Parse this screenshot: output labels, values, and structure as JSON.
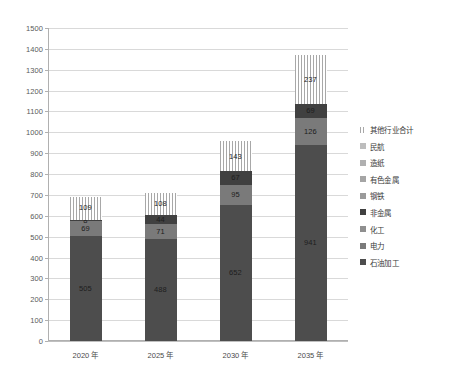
{
  "chart_data": {
    "type": "bar",
    "stacked": true,
    "title": "",
    "xlabel": "",
    "ylabel": "",
    "categories": [
      "2020 年",
      "2025 年",
      "2030 年",
      "2035 年"
    ],
    "ylim": [
      0,
      1500
    ],
    "ytick_step": 100,
    "ytick_labels": [
      "0",
      "100",
      "200",
      "300",
      "400",
      "500",
      "600",
      "700",
      "800",
      "900",
      "1000",
      "1100",
      "1200",
      "1300",
      "1400",
      "1500"
    ],
    "grid": true,
    "legend_position": "right",
    "series": [
      {
        "name": "石油加工",
        "color": "#4d4d4d",
        "pattern": "solid",
        "values": [
          505,
          488,
          652,
          941
        ],
        "labels": [
          "505",
          "488",
          "652",
          "941"
        ]
      },
      {
        "name": "电力",
        "color": "#7a7a7a",
        "pattern": "solid",
        "values": [
          69,
          71,
          95,
          126
        ],
        "labels": [
          "69",
          "71",
          "95",
          "126"
        ]
      },
      {
        "name": "化工",
        "color": "#8f8f8f",
        "pattern": "solid",
        "values": [
          0,
          0,
          0,
          0
        ],
        "labels": [
          "",
          "",
          "",
          ""
        ]
      },
      {
        "name": "非金属",
        "color": "#404040",
        "pattern": "solid",
        "values": [
          8,
          44,
          67,
          69
        ],
        "labels": [
          "8",
          "44",
          "67",
          "69"
        ]
      },
      {
        "name": "钢铁",
        "color": "#9a9a9a",
        "pattern": "solid",
        "values": [
          0,
          0,
          0,
          0
        ],
        "labels": [
          "",
          "",
          "",
          ""
        ]
      },
      {
        "name": "有色金属",
        "color": "#a5a5a5",
        "pattern": "solid",
        "values": [
          0,
          0,
          0,
          0
        ],
        "labels": [
          "",
          "",
          "",
          ""
        ]
      },
      {
        "name": "造纸",
        "color": "#b0b0b0",
        "pattern": "solid",
        "values": [
          0,
          0,
          0,
          0
        ],
        "labels": [
          "",
          "",
          "",
          ""
        ]
      },
      {
        "name": "民航",
        "color": "#bdbdbd",
        "pattern": "solid",
        "values": [
          0,
          0,
          0,
          0
        ],
        "labels": [
          "",
          "",
          "",
          ""
        ]
      },
      {
        "name": "其他行业合计",
        "color": "#ffffff",
        "pattern": "striped",
        "values": [
          109,
          108,
          143,
          237
        ],
        "labels": [
          "109",
          "108",
          "143",
          "237"
        ]
      }
    ],
    "legend_order": [
      "其他行业合计",
      "民航",
      "造纸",
      "有色金属",
      "钢铁",
      "非金属",
      "化工",
      "电力",
      "石油加工"
    ],
    "totals": [
      691,
      711,
      957,
      1373
    ]
  },
  "legend": {
    "items": [
      {
        "label": "其他行业合计",
        "color": "#ffffff",
        "pattern": "striped"
      },
      {
        "label": "民航",
        "color": "#bdbdbd",
        "pattern": "solid"
      },
      {
        "label": "造纸",
        "color": "#b0b0b0",
        "pattern": "solid"
      },
      {
        "label": "有色金属",
        "color": "#a5a5a5",
        "pattern": "solid"
      },
      {
        "label": "钢铁",
        "color": "#9a9a9a",
        "pattern": "solid"
      },
      {
        "label": "非金属",
        "color": "#404040",
        "pattern": "solid"
      },
      {
        "label": "化工",
        "color": "#8f8f8f",
        "pattern": "solid"
      },
      {
        "label": "电力",
        "color": "#7a7a7a",
        "pattern": "solid"
      },
      {
        "label": "石油加工",
        "color": "#4d4d4d",
        "pattern": "solid"
      }
    ]
  }
}
